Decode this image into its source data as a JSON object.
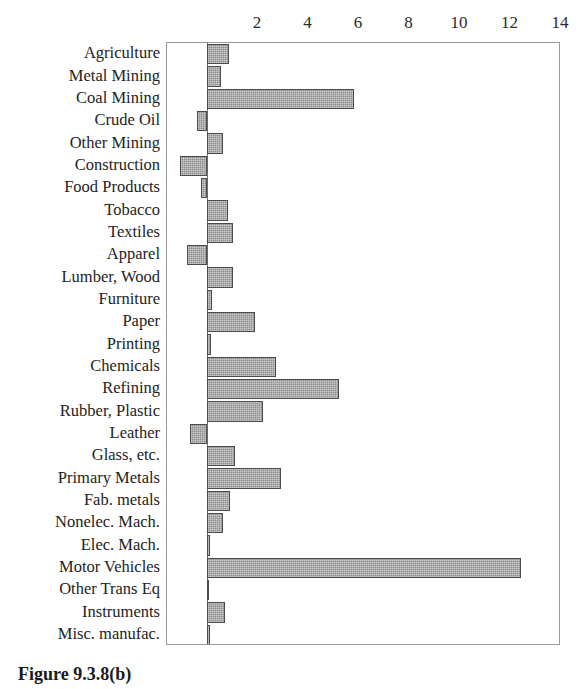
{
  "caption": "Figure 9.3.8(b)",
  "chart_data": {
    "type": "bar",
    "orientation": "horizontal",
    "title": "",
    "xlabel": "",
    "ylabel": "",
    "xlim": [
      -1.6,
      14
    ],
    "xticks": [
      2,
      4,
      6,
      8,
      10,
      12,
      14
    ],
    "xtick_labels": [
      "2",
      "4",
      "6",
      "8",
      "10",
      "12",
      "14"
    ],
    "grid": false,
    "legend": "none",
    "bar_color": "#8d8d8d",
    "bar_edge_color": "#4b4b4b",
    "axis_color": "#9a9a9a",
    "categories": [
      "Agriculture",
      "Metal Mining",
      "Coal Mining",
      "Crude Oil",
      "Other Mining",
      "Construction",
      "Food Products",
      "Tobacco",
      "Textiles",
      "Apparel",
      "Lumber, Wood",
      "Furniture",
      "Paper",
      "Printing",
      "Chemicals",
      "Refining",
      "Rubber, Plastic",
      "Leather",
      "Glass, etc.",
      "Primary Metals",
      "Fab. metals",
      "Nonelec. Mach.",
      "Elec. Mach.",
      "Motor Vehicles",
      "Other Trans Eq",
      "Instruments",
      "Misc. manufac."
    ],
    "values": [
      0.85,
      0.55,
      5.8,
      -0.4,
      0.6,
      -1.1,
      -0.25,
      0.8,
      1.0,
      -0.8,
      1.0,
      0.2,
      1.9,
      0.15,
      2.7,
      5.2,
      2.2,
      -0.7,
      1.1,
      2.9,
      0.9,
      0.6,
      0.1,
      12.4,
      0.05,
      0.7,
      0.1
    ]
  }
}
